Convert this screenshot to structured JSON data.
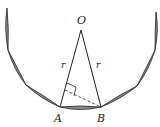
{
  "diagram": {
    "labels": {
      "center": "O",
      "point_a": "A",
      "point_b": "B",
      "radius_left": "r",
      "radius_right": "r"
    },
    "colors": {
      "stroke": "#222222",
      "segment_fill": "#8c8c8c"
    }
  }
}
